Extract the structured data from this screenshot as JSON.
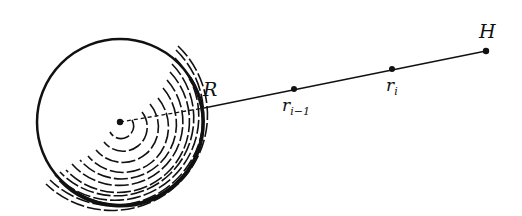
{
  "diagram": {
    "labels": {
      "R": "R",
      "r_prev_base": "r",
      "r_prev_sub": "i−1",
      "r_i_base": "r",
      "r_i_sub": "i",
      "H": "H"
    },
    "sphere": {
      "center": [
        120,
        122
      ],
      "radius": 83
    },
    "line": {
      "from": [
        204,
        108
      ],
      "to": [
        486,
        51
      ]
    },
    "points": [
      {
        "name": "r_{i-1}",
        "at": [
          294,
          89
        ]
      },
      {
        "name": "r_i",
        "at": [
          392,
          69
        ]
      },
      {
        "name": "H",
        "at": [
          486,
          51
        ]
      }
    ],
    "colors": {
      "ink": "#111111",
      "background": "#ffffff"
    }
  }
}
